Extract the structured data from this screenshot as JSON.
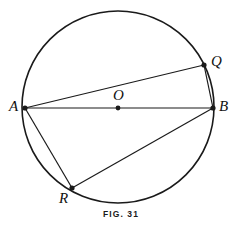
{
  "figure": {
    "caption": "FIG. 31",
    "colors": {
      "stroke": "#1a1a1a",
      "background": "#ffffff",
      "label": "#111111"
    },
    "circle": {
      "center_x": 118,
      "center_y": 107,
      "radius": 96,
      "stroke_width": 1.5
    },
    "points": [
      {
        "id": "A",
        "label": "A",
        "x": 25,
        "y": 108,
        "label_x": 9,
        "label_y": 99,
        "dot": true
      },
      {
        "id": "B",
        "label": "B",
        "x": 213,
        "y": 108,
        "label_x": 219,
        "label_y": 99,
        "dot": true
      },
      {
        "id": "Q",
        "label": "Q",
        "x": 204,
        "y": 65,
        "label_x": 211,
        "label_y": 54,
        "dot": true
      },
      {
        "id": "R",
        "label": "R",
        "x": 72,
        "y": 188,
        "label_x": 59,
        "label_y": 191,
        "dot": true
      },
      {
        "id": "O",
        "label": "O",
        "x": 118,
        "y": 108,
        "label_x": 113,
        "label_y": 88,
        "dot": true
      }
    ],
    "segments": [
      {
        "id": "AB",
        "from": "A",
        "to": "B",
        "name": "diameter-ab"
      },
      {
        "id": "AQ",
        "from": "A",
        "to": "Q",
        "name": "chord-aq"
      },
      {
        "id": "QB",
        "from": "Q",
        "to": "B",
        "name": "chord-qb"
      },
      {
        "id": "AR",
        "from": "A",
        "to": "R",
        "name": "chord-ar"
      },
      {
        "id": "RB",
        "from": "R",
        "to": "B",
        "name": "chord-rb"
      }
    ]
  }
}
